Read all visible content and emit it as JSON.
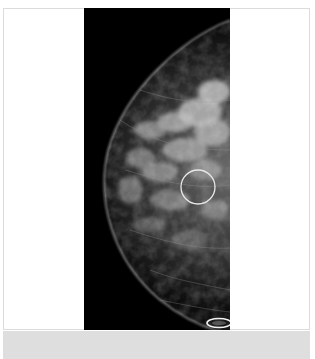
{
  "image": {
    "type": "mammogram",
    "view": "craniocaudal-like right breast profile",
    "annotations": [
      {
        "shape": "circle",
        "label": "region-of-interest",
        "cx": 198,
        "cy": 187,
        "r": 17
      },
      {
        "shape": "ellipse",
        "label": "nipple-marker",
        "cx": 219,
        "cy": 334,
        "rx": 12,
        "ry": 5
      }
    ],
    "colors": {
      "frame": "#ffffff",
      "frame_border": "#dcdcdc",
      "bottom_strip": "#dedede",
      "panel_background": "#000000",
      "tissue": "#bfbfbf",
      "annotation": "#e8e8e8"
    }
  }
}
